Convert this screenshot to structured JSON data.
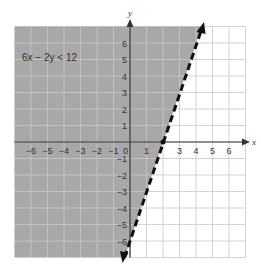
{
  "chart_data": {
    "type": "inequality-graph",
    "title": "",
    "inequality": "6x − 2y < 12",
    "boundary_line": {
      "equation": "y = 3x − 6",
      "style": "dashed",
      "slope": 3,
      "intercept": -6,
      "x_intercept": 2,
      "y_intercept": -6
    },
    "shaded_region": "above/left of line (y > 3x − 6)",
    "xlabel": "x",
    "ylabel": "y",
    "xlim": [
      -7,
      7
    ],
    "ylim": [
      -7,
      7
    ],
    "x_ticks": [
      -6,
      -5,
      -4,
      -3,
      -2,
      -1,
      0,
      1,
      3,
      4,
      5,
      6
    ],
    "y_ticks": [
      6,
      5,
      4,
      3,
      2,
      1,
      -1,
      -2,
      -3,
      -4,
      -5,
      -6
    ],
    "grid": true,
    "colors": {
      "shade": "#a8a8a8",
      "grid": "#c8c8c8",
      "axis": "#333333",
      "line": "#111111"
    }
  },
  "labels": {
    "inequality": "6x − 2y < 12",
    "x_axis": "x",
    "y_axis": "y",
    "origin": "0",
    "x_ticks": [
      "−6",
      "−5",
      "−4",
      "−3",
      "−2",
      "−1",
      "1",
      "3",
      "4",
      "5",
      "6"
    ],
    "y_ticks": [
      "6",
      "5",
      "4",
      "3",
      "2",
      "1",
      "−1",
      "−2",
      "−3",
      "−4",
      "−5",
      "−6"
    ]
  }
}
